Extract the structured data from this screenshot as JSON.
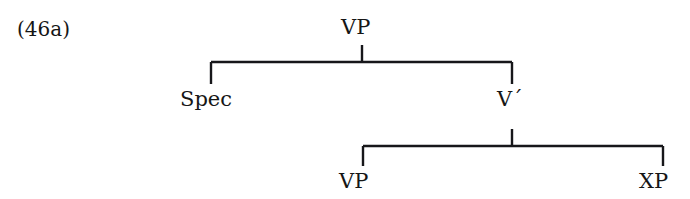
{
  "figure": {
    "example_number": "(46a)",
    "type": "syntax-tree",
    "nodes": {
      "root": "VP",
      "specifier": "Spec",
      "intermediate": "V´",
      "complement_left": "VP",
      "complement_right": "XP"
    },
    "colors": {
      "background": "#ffffff",
      "line": "#17171a",
      "text": "#161616"
    },
    "tree_structure": {
      "label": "VP",
      "children": [
        {
          "label": "Spec",
          "children": []
        },
        {
          "label": "V´",
          "children": [
            {
              "label": "VP",
              "children": []
            },
            {
              "label": "XP",
              "children": []
            }
          ]
        }
      ]
    }
  }
}
